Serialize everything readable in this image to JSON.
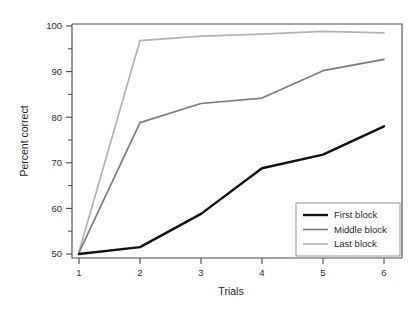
{
  "chart_data": {
    "type": "line",
    "title": "",
    "subtitle": "",
    "xlabel": "Trials",
    "ylabel": "Percent correct",
    "x": [
      1,
      2,
      3,
      4,
      5,
      6
    ],
    "xtick_labels": [
      "1",
      "2",
      "3",
      "4",
      "5",
      "6"
    ],
    "ytick_labels": [
      "50",
      "60",
      "70",
      "80",
      "90",
      "100"
    ],
    "ytick_values": [
      50,
      60,
      70,
      80,
      90,
      100
    ],
    "xlim": [
      1,
      6
    ],
    "ylim": [
      48,
      101
    ],
    "grid": false,
    "legend_position": "lower right",
    "series": [
      {
        "name": "First block",
        "color": "#111111",
        "width": 2.4,
        "values": [
          50.0,
          51.5,
          58.8,
          68.8,
          71.8,
          78.0
        ]
      },
      {
        "name": "Middle block",
        "color": "#7c7c7c",
        "width": 1.7,
        "values": [
          50.3,
          78.8,
          83.0,
          84.2,
          90.2,
          92.7
        ]
      },
      {
        "name": "Last block",
        "color": "#b3b3b3",
        "width": 1.7,
        "values": [
          50.5,
          96.8,
          97.8,
          98.2,
          98.8,
          98.5
        ]
      }
    ]
  },
  "axes": {
    "y_title": "Percent correct",
    "x_title": "Trials"
  },
  "legend": {
    "entries": [
      {
        "label": "First block"
      },
      {
        "label": "Middle block"
      },
      {
        "label": "Last block"
      }
    ]
  },
  "colors": {
    "first_block": "#111111",
    "middle_block": "#7c7c7c",
    "last_block": "#b3b3b3",
    "axis": "#4a4a4a",
    "background": "#ffffff"
  }
}
